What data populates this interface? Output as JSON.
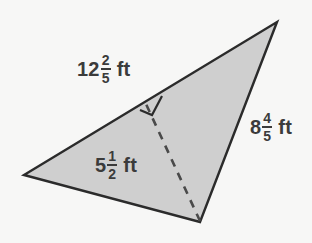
{
  "figure": {
    "type": "geometry-triangle-diagram",
    "background_color": "#f7f7f6",
    "fill_color": "#cfcfcf",
    "stroke_color": "#2b2b2b",
    "text_color": "#3b3b3b",
    "vertices": {
      "left": [
        24,
        175
      ],
      "top": [
        277,
        22
      ],
      "bottom": [
        200,
        222
      ]
    },
    "altitude": {
      "from": [
        200,
        222
      ],
      "foot": [
        146,
        104
      ],
      "style": "dashed",
      "right_angle_marker": true
    },
    "labels": {
      "hypotenuse": {
        "name": "side-length-12-2-5",
        "whole": "12",
        "numerator": "2",
        "denominator": "5",
        "unit": "ft"
      },
      "right_side": {
        "name": "side-length-8-4-5",
        "whole": "8",
        "numerator": "4",
        "denominator": "5",
        "unit": "ft"
      },
      "height": {
        "name": "height-5-1-2",
        "whole": "5",
        "numerator": "1",
        "denominator": "2",
        "unit": "ft"
      }
    }
  }
}
